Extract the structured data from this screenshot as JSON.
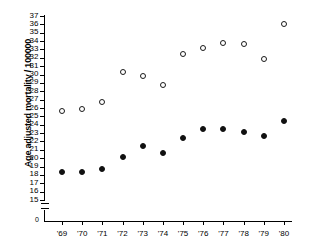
{
  "chart_data": {
    "type": "scatter",
    "title": "",
    "xlabel": "",
    "ylabel": "Age adjusted mortality / 100000",
    "x": [
      1969,
      1970,
      1971,
      1972,
      1973,
      1974,
      1975,
      1976,
      1977,
      1978,
      1979,
      1980
    ],
    "categories": [
      "'69",
      "'70",
      "'71",
      "'72",
      "'73",
      "'74",
      "'75",
      "'76",
      "'77",
      "'78",
      "'79",
      "'80"
    ],
    "ylim": [
      15,
      37
    ],
    "ytick_labels": [
      "37",
      "36",
      "35",
      "34",
      "33",
      "32",
      "31",
      "30",
      "29",
      "28",
      "27",
      "26",
      "25",
      "24",
      "23",
      "22",
      "21",
      "20",
      "19",
      "18",
      "17",
      "16",
      "15"
    ],
    "yticks": [
      37,
      36,
      35,
      34,
      33,
      32,
      31,
      30,
      29,
      28,
      27,
      26,
      25,
      24,
      23,
      22,
      21,
      20,
      19,
      18,
      17,
      16,
      15
    ],
    "axis_break": true,
    "origin_label": "0",
    "grid": false,
    "legend": "none",
    "series": [
      {
        "name": "open-circles",
        "marker": "open-circle",
        "color": "#1a1a1a",
        "values": [
          25.6,
          25.9,
          26.7,
          30.3,
          29.8,
          28.8,
          32.5,
          33.2,
          33.8,
          33.7,
          31.8,
          36.0
        ]
      },
      {
        "name": "filled-circles",
        "marker": "filled-circle",
        "color": "#111111",
        "values": [
          18.4,
          18.4,
          18.7,
          20.1,
          21.5,
          20.6,
          22.4,
          23.5,
          23.5,
          23.1,
          22.7,
          24.4
        ]
      }
    ]
  }
}
